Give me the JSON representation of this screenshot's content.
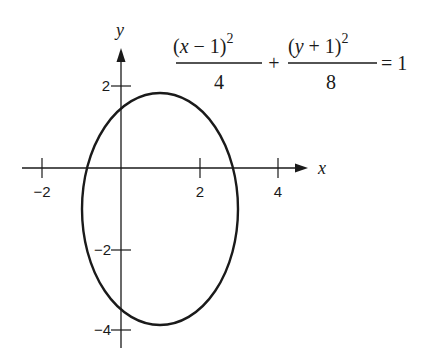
{
  "diagram": {
    "type": "ellipse-graph",
    "equation": {
      "term1": {
        "numerator_open": "(",
        "numerator_var": "x",
        "numerator_rest": " − 1)",
        "exponent": "2",
        "denominator": "4"
      },
      "plus": "+",
      "term2": {
        "numerator_open": "(",
        "numerator_var": "y",
        "numerator_rest": " + 1)",
        "exponent": "2",
        "denominator": "8"
      },
      "equals": "= 1"
    },
    "axes": {
      "x_label": "x",
      "y_label": "y",
      "x_ticks": [
        "−2",
        "2",
        "4"
      ],
      "y_ticks": [
        "2",
        "−2",
        "−4"
      ]
    },
    "ellipse": {
      "center": [
        1,
        -1
      ],
      "semi_axis_x": 2,
      "semi_axis_y": 2.828,
      "stroke_color": "#1a1a1a"
    },
    "colors": {
      "ink": "#1a1a1a",
      "background": "#ffffff"
    }
  }
}
